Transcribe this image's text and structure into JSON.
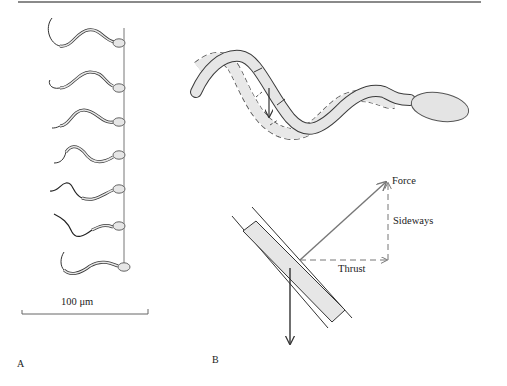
{
  "figure": {
    "panels": [
      {
        "id": "A",
        "label": "A",
        "description": "Sequence of seven frames of a swimming sperm cell aligned along a vertical reference line"
      },
      {
        "id": "B",
        "label": "B",
        "description": "Flagellum wave at two successive instants (solid and dashed) with force decomposition on a segment"
      }
    ],
    "scale_bar": {
      "label": "100 μm"
    },
    "vectors": {
      "force": "Force",
      "sideways": "Sideways",
      "thrust": "Thrust"
    },
    "colors": {
      "fill": "#e6e6e6",
      "stroke": "#3a3a3a",
      "dashed": "#7a7a7a",
      "rule": "#8a8a8a"
    },
    "frame_count": 7
  }
}
